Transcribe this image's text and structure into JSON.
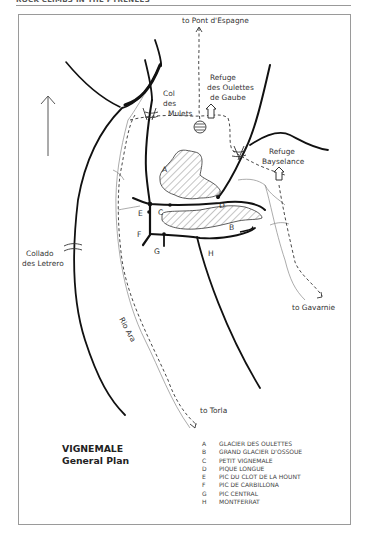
{
  "page": {
    "header": "ROCK CLIMBS IN THE PYRENEES"
  },
  "map": {
    "title_line1": "VIGNEMALE",
    "title_line2": "General Plan",
    "labels": {
      "to_pont_despagne": "to Pont d'Espagne",
      "refuge_oulettes_1": "Refuge",
      "refuge_oulettes_2": "des Oulettes",
      "refuge_oulettes_3": "de Gaube",
      "col_mulets_1": "Col",
      "col_mulets_2": "des",
      "col_mulets_3": "Mulets",
      "refuge_bayselance_1": "Refuge",
      "refuge_bayselance_2": "Bayselance",
      "collado_1": "Collado",
      "collado_2": "des Letrero",
      "to_gavarnie": "to Gavarnie",
      "rio_ara": "Rio Ara",
      "to_torla": "to Torla"
    },
    "point_letters": {
      "A": "A",
      "B": "B",
      "C": "C",
      "D": "D",
      "E": "E",
      "F": "F",
      "G": "G",
      "H": "H"
    },
    "icons": [
      "north-arrow-icon",
      "refuge-hut-icon",
      "lake-icon",
      "col-pass-icon"
    ]
  },
  "legend": {
    "items": [
      {
        "key": "A",
        "label": "GLACIER DES OULETTES"
      },
      {
        "key": "B",
        "label": "GRAND GLACIER D'OSSOUE"
      },
      {
        "key": "C",
        "label": "PETIT VIGNEMALE"
      },
      {
        "key": "D",
        "label": "PIQUE LONGUE"
      },
      {
        "key": "E",
        "label": "PIC DU CLOT DE LA HOUNT"
      },
      {
        "key": "F",
        "label": "PIC DE CARBILLONA"
      },
      {
        "key": "G",
        "label": "PIC CENTRAL"
      },
      {
        "key": "H",
        "label": "MONTFERRAT"
      }
    ]
  }
}
